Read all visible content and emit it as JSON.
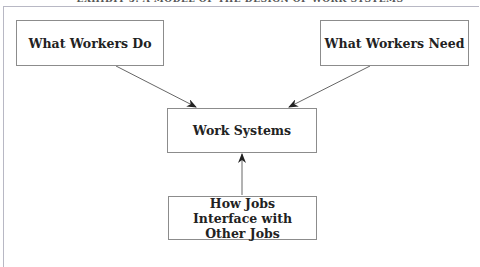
{
  "title": "EXHIBIT 5. A MODEL OF THE DESIGN OF WORK SYSTEMS",
  "nodes": {
    "what_workers_do": "What Workers Do",
    "what_workers_need": "What Workers Need",
    "work_systems": "Work Systems",
    "how_jobs_interface": "How Jobs Interface with Other Jobs"
  },
  "edges": [
    {
      "from": "What Workers Do",
      "to": "Work Systems"
    },
    {
      "from": "What Workers Need",
      "to": "Work Systems"
    },
    {
      "from": "How Jobs Interface with Other Jobs",
      "to": "Work Systems"
    }
  ],
  "colors": {
    "border": "#8c8c8c",
    "arrow": "#555555",
    "text": "#222222"
  }
}
